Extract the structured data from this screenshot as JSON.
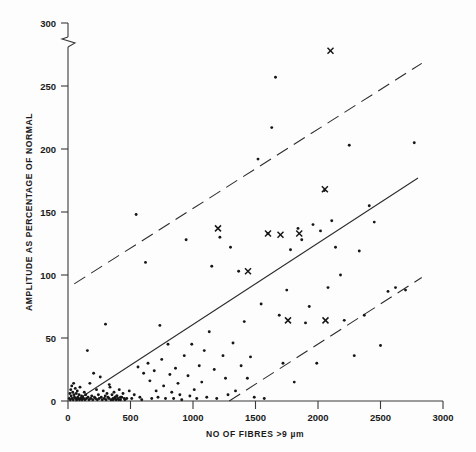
{
  "chart_data": {
    "type": "scatter",
    "title": "",
    "xlabel": "NO OF FIBRES >9 µm",
    "ylabel": "AMPLITUDE AS PERCENTAGE OF NORMAL",
    "xlim": [
      0,
      3000
    ],
    "ylim": [
      0,
      300
    ],
    "xticks": [
      0,
      500,
      1000,
      1500,
      2000,
      2500,
      3000
    ],
    "xtick_labels": [
      "0",
      "500",
      "1000",
      "1500",
      "2000",
      "2500",
      "3000"
    ],
    "yticks": [
      0,
      50,
      100,
      150,
      200,
      250,
      300
    ],
    "ytick_labels": [
      "0",
      "50",
      "100",
      "150",
      "200",
      "250",
      "300"
    ],
    "grid": false,
    "legend": "none",
    "axis_break": {
      "axis": "y",
      "between": [
        250,
        300
      ],
      "note": "zig-zag break mark on vertical axis above 250"
    },
    "series": [
      {
        "name": "observations-dot",
        "marker": "dot",
        "points": [
          [
            10,
            2
          ],
          [
            15,
            6
          ],
          [
            18,
            1
          ],
          [
            22,
            9
          ],
          [
            25,
            4
          ],
          [
            30,
            12
          ],
          [
            33,
            2
          ],
          [
            38,
            7
          ],
          [
            42,
            1
          ],
          [
            45,
            14
          ],
          [
            48,
            5
          ],
          [
            52,
            3
          ],
          [
            58,
            10
          ],
          [
            62,
            2
          ],
          [
            66,
            6
          ],
          [
            70,
            1
          ],
          [
            74,
            8
          ],
          [
            78,
            3
          ],
          [
            82,
            2
          ],
          [
            88,
            5
          ],
          [
            92,
            1
          ],
          [
            96,
            11
          ],
          [
            102,
            2
          ],
          [
            108,
            4
          ],
          [
            112,
            1
          ],
          [
            118,
            3
          ],
          [
            124,
            2
          ],
          [
            130,
            7
          ],
          [
            136,
            1
          ],
          [
            142,
            5
          ],
          [
            148,
            2
          ],
          [
            155,
            40
          ],
          [
            160,
            3
          ],
          [
            168,
            1
          ],
          [
            175,
            14
          ],
          [
            182,
            2
          ],
          [
            190,
            4
          ],
          [
            198,
            1
          ],
          [
            205,
            22
          ],
          [
            212,
            3
          ],
          [
            220,
            2
          ],
          [
            228,
            9
          ],
          [
            235,
            1
          ],
          [
            243,
            5
          ],
          [
            250,
            2
          ],
          [
            258,
            19
          ],
          [
            266,
            3
          ],
          [
            274,
            1
          ],
          [
            282,
            8
          ],
          [
            290,
            2
          ],
          [
            298,
            4
          ],
          [
            305,
            1
          ],
          [
            312,
            6
          ],
          [
            320,
            3
          ],
          [
            328,
            2
          ],
          [
            336,
            11
          ],
          [
            344,
            1
          ],
          [
            352,
            5
          ],
          [
            360,
            2
          ],
          [
            368,
            7
          ],
          [
            376,
            3
          ],
          [
            384,
            1
          ],
          [
            392,
            4
          ],
          [
            400,
            2
          ],
          [
            410,
            9
          ],
          [
            420,
            1
          ],
          [
            430,
            3
          ],
          [
            440,
            6
          ],
          [
            450,
            2
          ],
          [
            300,
            61
          ],
          [
            330,
            13
          ],
          [
            360,
            1
          ],
          [
            375,
            2
          ],
          [
            390,
            4
          ],
          [
            405,
            1
          ],
          [
            420,
            3
          ],
          [
            455,
            1
          ],
          [
            470,
            2
          ],
          [
            490,
            8
          ],
          [
            510,
            2
          ],
          [
            530,
            5
          ],
          [
            545,
            148
          ],
          [
            560,
            27
          ],
          [
            575,
            3
          ],
          [
            590,
            1
          ],
          [
            605,
            22
          ],
          [
            620,
            110
          ],
          [
            640,
            30
          ],
          [
            655,
            16
          ],
          [
            670,
            2
          ],
          [
            690,
            24
          ],
          [
            705,
            8
          ],
          [
            720,
            3
          ],
          [
            735,
            60
          ],
          [
            750,
            33
          ],
          [
            765,
            12
          ],
          [
            780,
            2
          ],
          [
            800,
            45
          ],
          [
            815,
            21
          ],
          [
            830,
            7
          ],
          [
            845,
            2
          ],
          [
            860,
            26
          ],
          [
            880,
            14
          ],
          [
            895,
            5
          ],
          [
            910,
            1
          ],
          [
            930,
            36
          ],
          [
            945,
            128
          ],
          [
            960,
            20
          ],
          [
            975,
            4
          ],
          [
            990,
            45
          ],
          [
            1010,
            9
          ],
          [
            1030,
            2
          ],
          [
            1050,
            28
          ],
          [
            1070,
            15
          ],
          [
            1090,
            40
          ],
          [
            1110,
            3
          ],
          [
            1130,
            55
          ],
          [
            1150,
            107
          ],
          [
            1170,
            25
          ],
          [
            1190,
            2
          ],
          [
            1215,
            130
          ],
          [
            1240,
            36
          ],
          [
            1260,
            18
          ],
          [
            1280,
            5
          ],
          [
            1300,
            122
          ],
          [
            1320,
            46
          ],
          [
            1340,
            8
          ],
          [
            1365,
            103
          ],
          [
            1385,
            28
          ],
          [
            1410,
            63
          ],
          [
            1435,
            18
          ],
          [
            1460,
            35
          ],
          [
            1490,
            3
          ],
          [
            1520,
            192
          ],
          [
            1545,
            77
          ],
          [
            1570,
            2
          ],
          [
            1600,
            133
          ],
          [
            1630,
            217
          ],
          [
            1660,
            257
          ],
          [
            1690,
            68
          ],
          [
            1720,
            30
          ],
          [
            1750,
            88
          ],
          [
            1780,
            120
          ],
          [
            1810,
            15
          ],
          [
            1840,
            137
          ],
          [
            1870,
            128
          ],
          [
            1900,
            62
          ],
          [
            1930,
            75
          ],
          [
            1960,
            140
          ],
          [
            1990,
            30
          ],
          [
            2020,
            135
          ],
          [
            2050,
            167
          ],
          [
            2080,
            90
          ],
          [
            2110,
            143
          ],
          [
            2140,
            122
          ],
          [
            2180,
            100
          ],
          [
            2210,
            64
          ],
          [
            2250,
            203
          ],
          [
            2290,
            36
          ],
          [
            2330,
            119
          ],
          [
            2370,
            68
          ],
          [
            2410,
            155
          ],
          [
            2450,
            142
          ],
          [
            2500,
            44
          ],
          [
            2560,
            87
          ],
          [
            2620,
            90
          ],
          [
            2700,
            88
          ],
          [
            2770,
            205
          ]
        ]
      },
      {
        "name": "observations-cross",
        "marker": "x",
        "points": [
          [
            1200,
            137
          ],
          [
            1440,
            103
          ],
          [
            1600,
            133
          ],
          [
            1700,
            132
          ],
          [
            1850,
            133
          ],
          [
            1760,
            64
          ],
          [
            2055,
            168
          ],
          [
            2100,
            278
          ],
          [
            2060,
            64
          ]
        ]
      }
    ],
    "lines": [
      {
        "name": "regression-line",
        "style": "solid",
        "x": [
          60,
          2800
        ],
        "y": [
          0,
          177
        ]
      },
      {
        "name": "upper-confidence-band",
        "style": "dashed",
        "x": [
          50,
          2830
        ],
        "y": [
          93,
          268
        ]
      },
      {
        "name": "lower-confidence-band",
        "style": "dashed",
        "x": [
          1290,
          2830
        ],
        "y": [
          0,
          98
        ]
      }
    ]
  }
}
